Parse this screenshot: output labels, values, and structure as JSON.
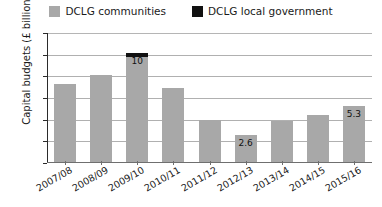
{
  "chart_data": {
    "type": "bar",
    "title": "",
    "subtitle": "",
    "xlabel": "",
    "ylabel": "Capital budgets  (£ billions)",
    "ylim": [
      0,
      12
    ],
    "yticks": [
      "0",
      "2",
      "4",
      "6",
      "8",
      "10",
      "12"
    ],
    "grid": true,
    "legend_position": "top-center",
    "stacked": true,
    "categories": [
      "2007/08",
      "2008/09",
      "2009/10",
      "2010/11",
      "2011/12",
      "2012/13",
      "2013/14",
      "2014/15",
      "2015/16"
    ],
    "series": [
      {
        "name": "DCLG communities",
        "color": "#a8a8a8",
        "values": [
          7.3,
          8.1,
          9.8,
          6.9,
          4.0,
          2.6,
          3.9,
          4.4,
          5.3
        ]
      },
      {
        "name": "DCLG local government",
        "color": "#111111",
        "values": [
          0,
          0,
          0.4,
          0,
          0,
          0,
          0,
          0,
          0
        ]
      }
    ],
    "totals": [
      7.3,
      8.1,
      10.2,
      6.9,
      4.0,
      2.6,
      3.9,
      4.4,
      5.3
    ],
    "data_labels": [
      {
        "category": "2009/10",
        "text": "10",
        "value": 10
      },
      {
        "category": "2012/13",
        "text": "2.6",
        "value": 2.6
      },
      {
        "category": "2015/16",
        "text": "5.3",
        "value": 5.3
      }
    ]
  },
  "legend": {
    "entries": [
      {
        "label": "DCLG communities",
        "color": "#a8a8a8"
      },
      {
        "label": "DCLG local government",
        "color": "#111111"
      }
    ]
  },
  "axes": {
    "y_title": "Capital budgets  (£ billions)"
  }
}
